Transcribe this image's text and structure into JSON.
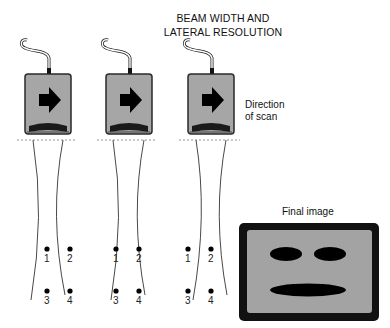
{
  "title": {
    "line1": "BEAM WIDTH AND",
    "line2": "LATERAL RESOLUTION"
  },
  "direction_label": {
    "line1": "Direction",
    "line2": "of scan"
  },
  "final_image_label": "Final image",
  "transducers": [
    {
      "position": 1,
      "icon": "arrow-right-icon"
    },
    {
      "position": 2,
      "icon": "arrow-right-icon"
    },
    {
      "position": 3,
      "icon": "arrow-right-icon"
    }
  ],
  "reflector_labels": [
    "1",
    "2",
    "3",
    "4"
  ],
  "colors": {
    "probe_body": "#a6a6a6",
    "probe_outline": "#2a2a2a",
    "screen_frame": "#111111",
    "screen_fill": "#a3a3a3",
    "features": "#000000"
  }
}
